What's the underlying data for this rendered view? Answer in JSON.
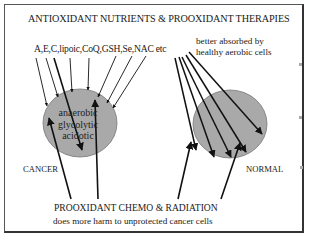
{
  "diagram": {
    "title": "ANTIOXIDANT NUTRIENTS & PROOXIDANT THERAPIES",
    "antioxidant_agents": "A,E,C,lipoic,CoQ,GSH,Se,NAC etc",
    "absorption_note": {
      "line1": "better absorbed by",
      "line2": "healthy aerobic cells"
    },
    "cancer_cell": {
      "label": "CANCER",
      "inner_text": [
        "anaerobic",
        "glycolytic",
        "acidotic"
      ],
      "fill_color": "#a9a9a9"
    },
    "normal_cell": {
      "label": "NORMAL",
      "fill_color": "#a9a9a9"
    },
    "prooxidant": {
      "title": "PROOXIDANT CHEMO & RADIATION",
      "note": "does more harm to unprotected cancer cells"
    }
  }
}
